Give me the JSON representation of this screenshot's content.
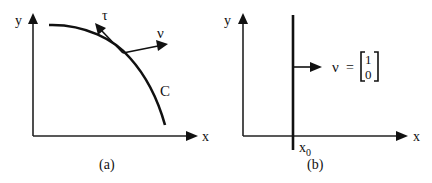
{
  "figure": {
    "panels": [
      {
        "id": "a",
        "caption": "(a)",
        "axes": {
          "x_label": "x",
          "y_label": "y"
        },
        "curve_label": "C",
        "tangent_label": "τ",
        "normal_label": "ν"
      },
      {
        "id": "b",
        "caption": "(b)",
        "axes": {
          "x_label": "x",
          "y_label": "y"
        },
        "line_label": "x",
        "line_label_sub": "0",
        "normal_label": "ν",
        "equals": "=",
        "vector_top": "1",
        "vector_bottom": "0"
      }
    ]
  }
}
